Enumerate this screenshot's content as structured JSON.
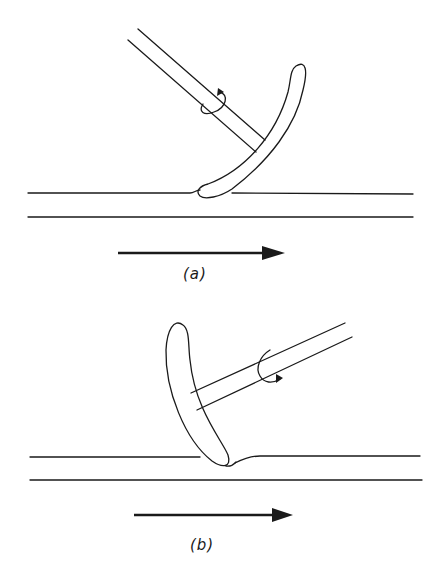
{
  "figure": {
    "panels": [
      {
        "id": "a",
        "label": "(a)",
        "description": "Curved tool on shaft contacting lower surface, tilted right; rotation arrow around shaft; motion arrow pointing right",
        "motion_direction": "right"
      },
      {
        "id": "b",
        "label": "(b)",
        "description": "Curved tool on shaft contacting surface, tilted left with shaft extending upper-right; rotation arrow around shaft; motion arrow pointing right",
        "motion_direction": "right"
      }
    ],
    "colors": {
      "ink": "#1a1a1a",
      "background": "#ffffff"
    }
  }
}
